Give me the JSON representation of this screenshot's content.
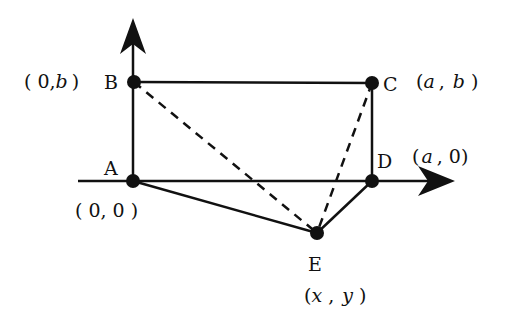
{
  "diagram": {
    "axes": {
      "x_axis": "horizontal axis through A",
      "y_axis": "vertical axis through A"
    },
    "points": [
      {
        "name": "A",
        "coord": "( 0, 0 )",
        "x": 133,
        "y": 181
      },
      {
        "name": "B",
        "coord": "( 0,b )",
        "x": 134,
        "y": 82
      },
      {
        "name": "C",
        "coord": "(a , b )",
        "x": 372,
        "y": 83
      },
      {
        "name": "D",
        "coord": "(a , 0)",
        "x": 372,
        "y": 181
      },
      {
        "name": "E",
        "coord": "(x , y )",
        "x": 317,
        "y": 233
      }
    ],
    "labels": {
      "A": "A",
      "B": "B",
      "C": "C",
      "D": "D",
      "E": "E",
      "A_coord": "( 0, 0 )",
      "B_coord_open": "( 0,",
      "B_coord_var": "b",
      "B_coord_close": ")",
      "C_coord_open": "(",
      "C_coord_a": "a",
      "C_coord_sep": ",",
      "C_coord_b": "b",
      "C_coord_close": ")",
      "D_coord_open": "(",
      "D_coord_a": "a",
      "D_coord_rest": ", 0)",
      "E_coord_open": "(",
      "E_coord_x": "x",
      "E_coord_sep": ",",
      "E_coord_y": "y",
      "E_coord_close": ")"
    },
    "segments": {
      "solid": [
        "AB",
        "BC",
        "CD",
        "AE",
        "ED"
      ],
      "dashed": [
        "BE",
        "CE"
      ]
    },
    "colors": {
      "stroke": "#111111",
      "background": "#ffffff"
    }
  }
}
